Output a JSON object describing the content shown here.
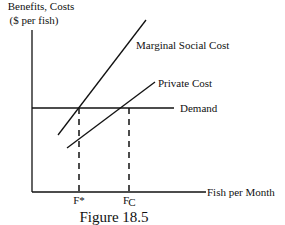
{
  "figure": {
    "caption": "Figure 18.5",
    "y_axis_label_line1": "Benefits, Costs",
    "y_axis_label_line2": "($ per fish)",
    "x_axis_label": "Fish per Month",
    "curves": {
      "msc": "Marginal Social Cost",
      "private": "Private Cost",
      "demand": "Demand"
    },
    "ticks": {
      "f_star": "F*",
      "f_c_main": "F",
      "f_c_sub": "C"
    }
  }
}
